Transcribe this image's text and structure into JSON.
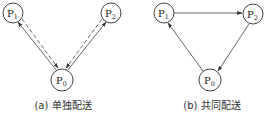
{
  "panels": [
    {
      "id": "a",
      "caption": "(a) 单独配送",
      "nodes": [
        {
          "name": "P1",
          "main": "P",
          "sub": "1",
          "cx": 13,
          "cy": 13
        },
        {
          "name": "P2",
          "main": "P",
          "sub": "2",
          "cx": 111,
          "cy": 13
        },
        {
          "name": "P0",
          "main": "P",
          "sub": "0",
          "cx": 62,
          "cy": 80
        }
      ],
      "edges": [
        {
          "from": "P0",
          "to": "P1",
          "style": "solid",
          "direction": "P0 to P1"
        },
        {
          "from": "P1",
          "to": "P0",
          "style": "dashed",
          "direction": "P1 to P0"
        },
        {
          "from": "P0",
          "to": "P2",
          "style": "solid",
          "direction": "P0 to P2"
        },
        {
          "from": "P2",
          "to": "P0",
          "style": "dashed",
          "direction": "P2 to P0"
        }
      ]
    },
    {
      "id": "b",
      "caption": "(b) 共同配送",
      "nodes": [
        {
          "name": "P1",
          "main": "P",
          "sub": "1",
          "cx": 164,
          "cy": 13
        },
        {
          "name": "P2",
          "main": "P",
          "sub": "2",
          "cx": 253,
          "cy": 14
        },
        {
          "name": "P0",
          "main": "P",
          "sub": "0",
          "cx": 210,
          "cy": 80
        }
      ],
      "edges": [
        {
          "from": "P1",
          "to": "P2",
          "style": "solid"
        },
        {
          "from": "P2",
          "to": "P0",
          "style": "solid"
        },
        {
          "from": "P0",
          "to": "P1",
          "style": "solid"
        }
      ]
    }
  ],
  "colors": {
    "stroke": "#444444",
    "text": "#222222",
    "background": "#ffffff"
  }
}
